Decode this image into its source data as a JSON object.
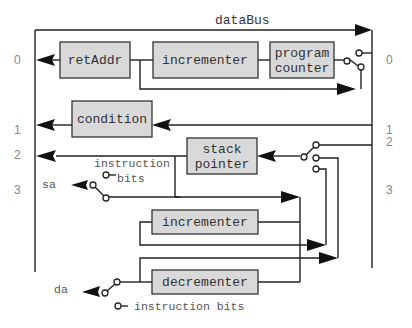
{
  "diagram": {
    "bus_label": "dataBus",
    "blocks": {
      "ret_addr": "retAddr",
      "incrementer_top": "incrementer",
      "program_counter_line1": "program",
      "program_counter_line2": "counter",
      "condition": "condition",
      "stack_pointer_line1": "stack",
      "stack_pointer_line2": "pointer",
      "incrementer_mid": "incrementer",
      "decrementer": "decrementer"
    },
    "ports_left": [
      "0",
      "1",
      "2",
      "3"
    ],
    "ports_right": [
      "0",
      "1",
      "2",
      "3"
    ],
    "signals": {
      "sa": "sa",
      "da": "da",
      "instruction_bits_top_line1": "instruction",
      "instruction_bits_top_line2": "bits",
      "instruction_bits_bottom": "instruction bits"
    },
    "colors": {
      "block_fill": "#d9d9d9",
      "wire": "#222222",
      "port_text": "#888888"
    }
  }
}
